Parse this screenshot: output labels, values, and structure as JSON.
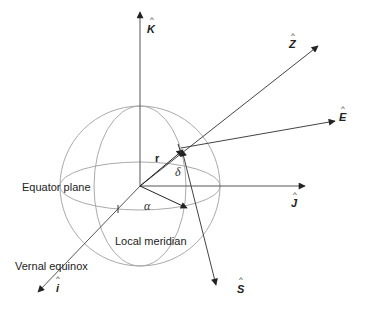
{
  "diagram": {
    "axes": {
      "K": {
        "symbol": "K",
        "hat": "^"
      },
      "Z": {
        "symbol": "Z",
        "hat": "^"
      },
      "E": {
        "symbol": "E",
        "hat": "^"
      },
      "J": {
        "symbol": "J",
        "hat": "^"
      },
      "I": {
        "symbol": "i",
        "hat": "^"
      },
      "S": {
        "symbol": "S",
        "hat": "^"
      }
    },
    "labels": {
      "r": "r",
      "delta": "δ",
      "alpha": "α",
      "equator": "Equator plane",
      "meridian": "Local meridian",
      "vernal": "Vernal equinox"
    },
    "colors": {
      "axis": "#333333",
      "sphere": "#aaaaaa"
    }
  }
}
